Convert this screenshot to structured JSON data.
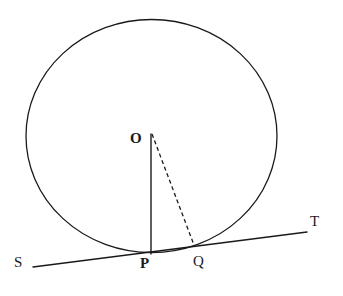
{
  "figure": {
    "background_color": "#ffffff",
    "stroke_color": "#1a1a1a",
    "width": 343,
    "height": 296
  },
  "labels": {
    "center": "O",
    "tangent_point": "P",
    "secant_point": "Q",
    "line_left_end": "S",
    "line_right_end": "T"
  },
  "geometry": {
    "circle": {
      "center_x": 151.5,
      "center_y": 136,
      "radius_x": 125.5,
      "radius_y": 116.5,
      "stroke_width": 1.3
    },
    "tangent_line": {
      "x1": 33,
      "y1": 267,
      "x2": 307,
      "y2": 232,
      "stroke_width": 1.4,
      "style": "solid"
    },
    "radius_segment_OP": {
      "x1": 151,
      "y1": 134,
      "x2": 151,
      "y2": 254,
      "stroke_width": 1.4,
      "style": "solid"
    },
    "chord_segment_OQ": {
      "x1": 152,
      "y1": 134,
      "x2": 194,
      "y2": 245,
      "stroke_width": 1.3,
      "style": "dashed",
      "dash_pattern": "4 3"
    }
  }
}
